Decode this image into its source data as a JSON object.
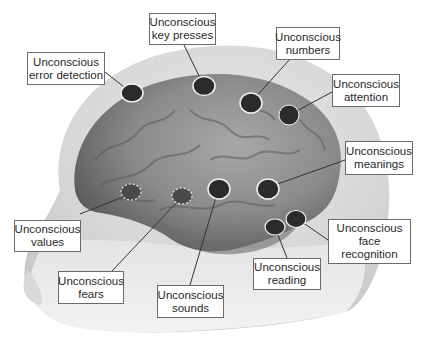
{
  "figure": {
    "colors": {
      "background": "#ffffff",
      "head": "#dedede",
      "head_shadow": "#bdbdbd",
      "brain": "#8a8a8a",
      "brain_dark": "#4a4a4a",
      "marker_fill": "#2b2b2b",
      "marker_ring": "#f2f2f2",
      "leader_line": "#333333",
      "label_border": "#6a6a6a"
    }
  },
  "labels": [
    {
      "id": "error-detection",
      "line1": "Unconscious",
      "line2": "error detection",
      "line3": "",
      "marker_style": "solid"
    },
    {
      "id": "key-presses",
      "line1": "Unconscious",
      "line2": "key presses",
      "line3": "",
      "marker_style": "solid"
    },
    {
      "id": "numbers",
      "line1": "Unconscious",
      "line2": "numbers",
      "line3": "",
      "marker_style": "solid"
    },
    {
      "id": "attention",
      "line1": "Unconscious",
      "line2": "attention",
      "line3": "",
      "marker_style": "solid"
    },
    {
      "id": "meanings",
      "line1": "Unconscious",
      "line2": "meanings",
      "line3": "",
      "marker_style": "solid"
    },
    {
      "id": "values",
      "line1": "Unconscious",
      "line2": "values",
      "line3": "",
      "marker_style": "dashed"
    },
    {
      "id": "fears",
      "line1": "Unconscious",
      "line2": "fears",
      "line3": "",
      "marker_style": "dashed"
    },
    {
      "id": "sounds",
      "line1": "Unconscious",
      "line2": "sounds",
      "line3": "",
      "marker_style": "solid"
    },
    {
      "id": "reading",
      "line1": "Unconscious",
      "line2": "reading",
      "line3": "",
      "marker_style": "solid"
    },
    {
      "id": "face-recognition",
      "line1": "Unconscious",
      "line2": "face",
      "line3": "recognition",
      "marker_style": "solid"
    }
  ]
}
